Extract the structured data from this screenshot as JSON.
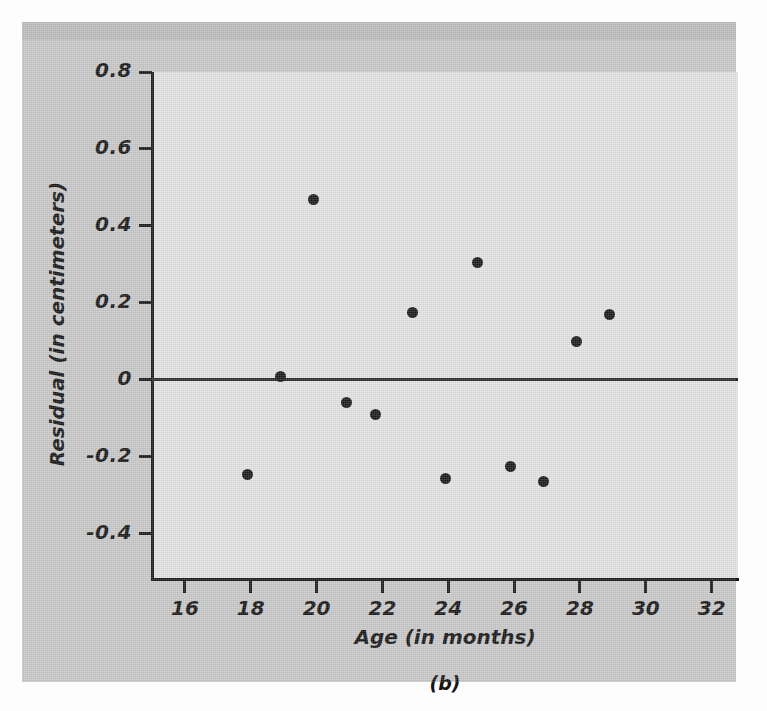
{
  "figure": {
    "caption": "(b)",
    "background_color": "#c9c9c9",
    "plot_background_color": "#e3e3e3",
    "ink_color": "#1a1a1a"
  },
  "chart_data": {
    "type": "scatter",
    "title": "",
    "subtitle": "",
    "xlabel": "Age (in months)",
    "ylabel": "Residual (in centimeters)",
    "xlim": [
      15.0,
      32.8
    ],
    "ylim": [
      -0.52,
      0.8
    ],
    "xticks": [
      16,
      18,
      20,
      22,
      24,
      26,
      28,
      30,
      32
    ],
    "xtick_labels": [
      "16",
      "18",
      "20",
      "22",
      "24",
      "26",
      "28",
      "30",
      "32"
    ],
    "yticks": [
      0.8,
      0.6,
      0.4,
      0.2,
      0,
      -0.2,
      -0.4
    ],
    "ytick_labels": [
      "0.8",
      "0.6",
      "0.4",
      "0.2",
      "0",
      "-0.2",
      "-0.4"
    ],
    "grid": false,
    "legend": null,
    "reference_lines": [
      {
        "name": "zero-residual-line",
        "orientation": "horizontal",
        "y": 0,
        "color": "#2b2b2b"
      }
    ],
    "series": [
      {
        "name": "residuals",
        "marker": "filled-circle",
        "color": "#1a1a1a",
        "points": [
          {
            "x": 17.9,
            "y": -0.245
          },
          {
            "x": 18.9,
            "y": 0.01
          },
          {
            "x": 19.9,
            "y": 0.47
          },
          {
            "x": 20.9,
            "y": -0.06
          },
          {
            "x": 21.8,
            "y": -0.09
          },
          {
            "x": 22.9,
            "y": 0.175
          },
          {
            "x": 23.9,
            "y": -0.255
          },
          {
            "x": 24.9,
            "y": 0.305
          },
          {
            "x": 25.9,
            "y": -0.225
          },
          {
            "x": 26.9,
            "y": -0.265
          },
          {
            "x": 27.9,
            "y": 0.1
          },
          {
            "x": 28.9,
            "y": 0.17
          }
        ]
      }
    ]
  }
}
